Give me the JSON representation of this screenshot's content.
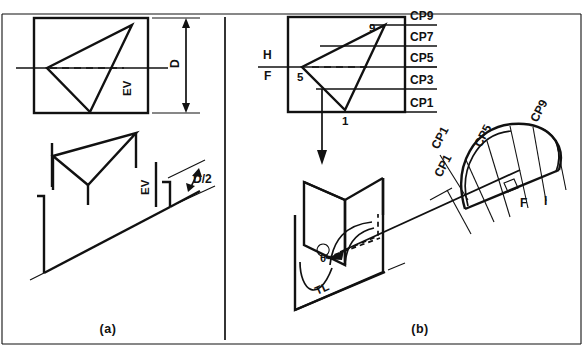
{
  "figure": {
    "title_panels": [
      {
        "key": "a",
        "label": "(a)"
      },
      {
        "key": "b",
        "label": "(b)"
      }
    ],
    "panel_a": {
      "dimension_label": "D",
      "edge_view_label_top": "EV",
      "edge_view_label_bottom": "EV",
      "half_dimension_label": "D/2"
    },
    "panel_b": {
      "reference_line_labels": {
        "horizontal": "H",
        "frontal": "F"
      },
      "cutting_planes": [
        "CP9",
        "CP7",
        "CP5",
        "CP3",
        "CP1"
      ],
      "vertex_labels": {
        "top": "9",
        "left": "5",
        "bottom": "1"
      },
      "pictorial": {
        "true_length_label": "TL",
        "angle_label": "θ",
        "arrow_label": "CP1"
      },
      "auxiliary": {
        "labels": [
          "CP1",
          "CP5",
          "CP9"
        ],
        "plane_labels": [
          "F",
          "I"
        ]
      }
    }
  }
}
